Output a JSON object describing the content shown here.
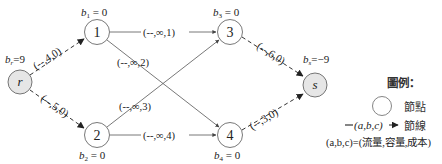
{
  "diagram": {
    "nodes": [
      {
        "id": "r",
        "label": "r",
        "supply_label": "b_r=9",
        "sub": "r",
        "val": "=9",
        "x": 20,
        "y": 82,
        "fill": "#e6e6e6"
      },
      {
        "id": "1",
        "label": "1",
        "supply_label": "b_1 = 0",
        "sub": "1",
        "val": " = 0",
        "x": 97,
        "y": 32,
        "fill": "#ffffff"
      },
      {
        "id": "2",
        "label": "2",
        "supply_label": "b_2 = 0",
        "sub": "2",
        "val": " = 0",
        "x": 97,
        "y": 135,
        "fill": "#ffffff"
      },
      {
        "id": "3",
        "label": "3",
        "supply_label": "b_3 = 0",
        "sub": "3",
        "val": " = 0",
        "x": 230,
        "y": 32,
        "fill": "#ffffff"
      },
      {
        "id": "4",
        "label": "4",
        "supply_label": "b_4 = 0",
        "sub": "4",
        "val": " = 0",
        "x": 230,
        "y": 135,
        "fill": "#ffffff"
      },
      {
        "id": "s",
        "label": "s",
        "supply_label": "b_s=-9",
        "sub": "s",
        "val": "=−9",
        "x": 315,
        "y": 85,
        "fill": "#e6e6e6"
      }
    ],
    "edges": [
      {
        "from": "r",
        "to": "1",
        "label": "(--,4,0)",
        "style": "dashed"
      },
      {
        "from": "r",
        "to": "2",
        "label": "(--,5,0)",
        "style": "dashed"
      },
      {
        "from": "1",
        "to": "3",
        "label": "(--,∞,1)",
        "style": "solid"
      },
      {
        "from": "1",
        "to": "4",
        "label": "(--,∞,2)",
        "style": "solid"
      },
      {
        "from": "2",
        "to": "3",
        "label": "(--,∞,3)",
        "style": "solid"
      },
      {
        "from": "2",
        "to": "4",
        "label": "(--,∞,4)",
        "style": "solid"
      },
      {
        "from": "3",
        "to": "s",
        "label": "(--,6,0)",
        "style": "dashed"
      },
      {
        "from": "4",
        "to": "s",
        "label": "(--,3,0)",
        "style": "dashed"
      }
    ]
  },
  "legend": {
    "title": "圖例：",
    "node_label": "節點",
    "edge_sample": "(a,b,c)",
    "edge_label": "節線",
    "formula": "(a,b,c)=(流量,容量,成本)"
  }
}
